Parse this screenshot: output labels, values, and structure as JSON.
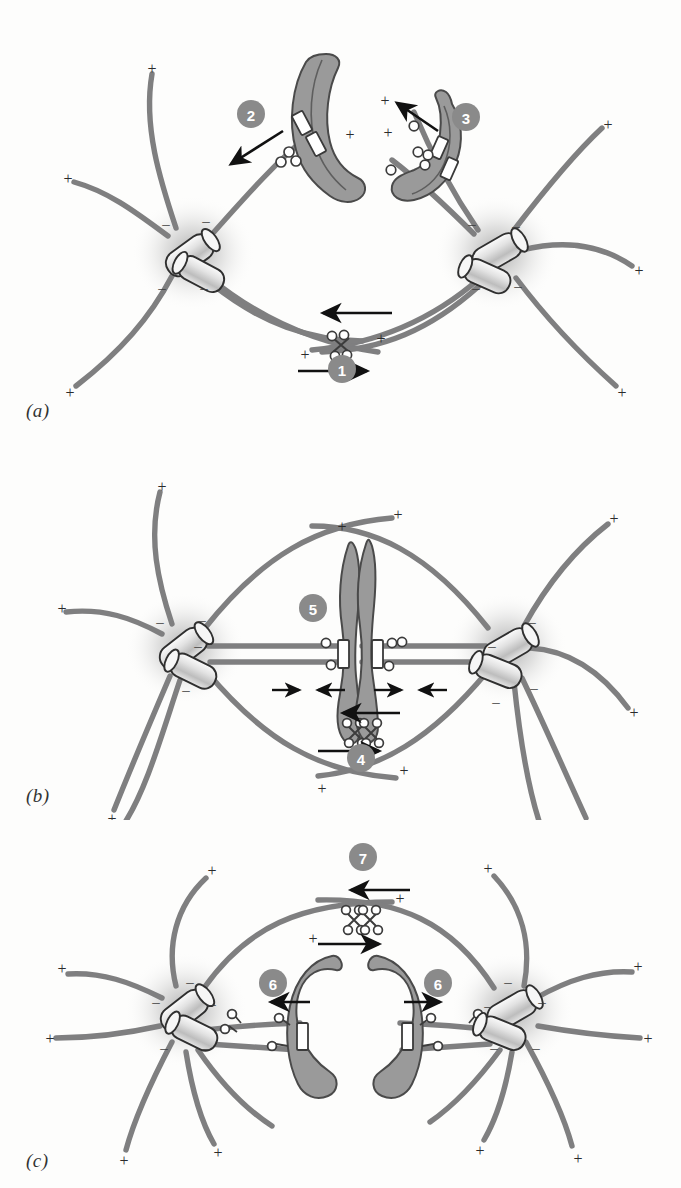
{
  "figure": {
    "background_color": "#fdfdfc",
    "colors": {
      "microtubule": "#7f7f80",
      "chromosome_fill": "#9a9a9a",
      "chromosome_stroke": "#4a4a4a",
      "centriole_fill": "#d8d8d8",
      "centriole_stroke": "#2f2f2f",
      "kinetochore_fill": "#ffffff",
      "kinetochore_stroke": "#3a3a3a",
      "motor_fill": "#ffffff",
      "motor_stroke": "#3c3c3c",
      "badge_fill": "#8a8a8a",
      "badge_text": "#ffffff",
      "arrow": "#111111",
      "aster_glow": "#b9b9b9"
    },
    "polarity": {
      "plus": "+",
      "minus": "–"
    }
  },
  "panels": [
    {
      "id": "a",
      "label": "(a)",
      "caption_phase": "prometaphase",
      "badges": [
        {
          "number": "1",
          "cx": 342,
          "cy": 369,
          "describes": "interpolar-microtubule-sliding"
        },
        {
          "number": "2",
          "cx": 251,
          "cy": 114,
          "describes": "chromosome-arm-pushing-polar-ejection"
        },
        {
          "number": "3",
          "cx": 466,
          "cy": 117,
          "describes": "kinetochore-capture-poleward-movement"
        }
      ],
      "poles": [
        {
          "name": "left-pole",
          "cx": 193,
          "cy": 253
        },
        {
          "name": "right-pole",
          "cx": 497,
          "cy": 253
        }
      ],
      "chromosomes": [
        {
          "name": "chromosome-left",
          "cx": 313,
          "cy": 128
        },
        {
          "name": "chromosome-right",
          "cx": 432,
          "cy": 148
        }
      ],
      "arrows": [
        {
          "name": "arrow-polar-ejection",
          "from": [
            283,
            131
          ],
          "to": [
            228,
            166
          ]
        },
        {
          "name": "arrow-kinetochore-poleward",
          "from": [
            438,
            131
          ],
          "to": [
            394,
            101
          ]
        },
        {
          "name": "arrow-interpolar-left",
          "from": [
            392,
            313
          ],
          "to": [
            320,
            313
          ]
        },
        {
          "name": "arrow-interpolar-right",
          "from": [
            298,
            371
          ],
          "to": [
            370,
            371
          ]
        }
      ],
      "motor_complexes": [
        {
          "name": "bipolar-kinesin",
          "cx": 341,
          "cy": 344
        },
        {
          "name": "kinetochore-motor-left",
          "cx": 290,
          "cy": 160
        },
        {
          "name": "kinetochore-motor-right",
          "cx": 420,
          "cy": 152
        }
      ]
    },
    {
      "id": "b",
      "label": "(b)",
      "caption_phase": "metaphase",
      "badges": [
        {
          "number": "4",
          "cx": 361,
          "cy": 318,
          "describes": "interpolar-microtubule-sliding"
        },
        {
          "number": "5",
          "cx": 313,
          "cy": 168,
          "describes": "metaphase-chromosome-balanced-forces"
        }
      ],
      "poles": [
        {
          "name": "left-pole",
          "cx": 185,
          "cy": 208
        },
        {
          "name": "right-pole",
          "cx": 508,
          "cy": 208
        }
      ],
      "chromosomes": [
        {
          "name": "metaphase-chromosome",
          "cx": 355,
          "cy": 215
        }
      ],
      "arrows": [
        {
          "name": "arrow-balance-left-outward",
          "from": [
            272,
            250
          ],
          "to": [
            302,
            250
          ]
        },
        {
          "name": "arrow-balance-left-inward",
          "from": [
            345,
            250
          ],
          "to": [
            315,
            250
          ]
        },
        {
          "name": "arrow-balance-right-outward",
          "from": [
            374,
            250
          ],
          "to": [
            404,
            250
          ]
        },
        {
          "name": "arrow-balance-right-inward",
          "from": [
            447,
            250
          ],
          "to": [
            417,
            250
          ]
        },
        {
          "name": "arrow-interpolar-left",
          "from": [
            400,
            273
          ],
          "to": [
            340,
            273
          ]
        },
        {
          "name": "arrow-interpolar-right",
          "from": [
            318,
            311
          ],
          "to": [
            382,
            311
          ]
        }
      ],
      "motor_complexes": [
        {
          "name": "bipolar-kinesin",
          "cx": 363,
          "cy": 292
        }
      ]
    },
    {
      "id": "c",
      "label": "(c)",
      "caption_phase": "anaphase",
      "badges": [
        {
          "number": "6",
          "cx": 273,
          "cy": 163,
          "describes": "chromatid-to-pole-anaphase-A"
        },
        {
          "number": "6",
          "cx": 438,
          "cy": 163,
          "describes": "chromatid-to-pole-anaphase-A"
        },
        {
          "number": "7",
          "cx": 363,
          "cy": 37,
          "describes": "pole-separation-anaphase-B"
        }
      ],
      "poles": [
        {
          "name": "left-pole",
          "cx": 186,
          "cy": 190
        },
        {
          "name": "right-pole",
          "cx": 512,
          "cy": 190
        }
      ],
      "chromosomes": [
        {
          "name": "chromatid-left",
          "cx": 322,
          "cy": 215
        },
        {
          "name": "chromatid-right",
          "cx": 388,
          "cy": 215
        }
      ],
      "arrows": [
        {
          "name": "arrow-chromatid-left",
          "from": [
            310,
            182
          ],
          "to": [
            268,
            182
          ]
        },
        {
          "name": "arrow-chromatid-right",
          "from": [
            404,
            182
          ],
          "to": [
            443,
            182
          ]
        },
        {
          "name": "arrow-interpolar-left",
          "from": [
            410,
            70
          ],
          "to": [
            348,
            70
          ]
        },
        {
          "name": "arrow-interpolar-right",
          "from": [
            318,
            124
          ],
          "to": [
            382,
            124
          ]
        }
      ],
      "motor_complexes": [
        {
          "name": "bipolar-kinesin",
          "cx": 362,
          "cy": 99
        }
      ]
    }
  ],
  "legend_keys": {
    "plus_end": "+",
    "minus_end": "–"
  }
}
